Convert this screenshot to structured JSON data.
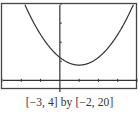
{
  "chart_data": {
    "type": "line",
    "title": "",
    "xlabel": "",
    "ylabel": "",
    "xlim": [
      -3,
      4
    ],
    "ylim": [
      -2,
      20
    ],
    "x_tick_step": 1,
    "y_tick_step": 5,
    "grid": false,
    "legend": null,
    "series": [
      {
        "name": "parabola",
        "function": "y = 2(x - 1)^2 + 4",
        "vertex": [
          1,
          4
        ],
        "x": [
          -2.2,
          -2,
          -1.5,
          -1,
          -0.5,
          0,
          0.5,
          1,
          1.5,
          2,
          2.5,
          3,
          3.5,
          4
        ],
        "values": [
          24.48,
          22,
          16.5,
          12,
          8.5,
          6,
          4.5,
          4,
          4.5,
          6,
          8.5,
          12,
          16.5,
          22
        ]
      }
    ],
    "caption": "[−3, 4] by [−2, 20]"
  },
  "window": {
    "caption": "[−3, 4] by [−2, 20]"
  },
  "colors": {
    "frame": "#444444",
    "axes": "#333333",
    "curve": "#333333",
    "background": "#ffffff"
  }
}
